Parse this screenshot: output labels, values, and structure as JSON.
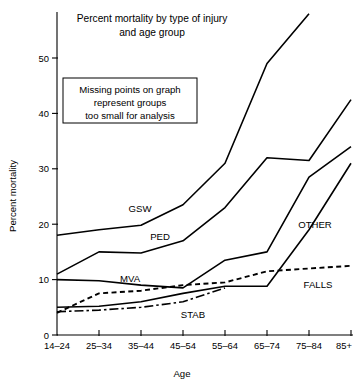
{
  "chart_data": {
    "type": "line",
    "title": "Percent mortality by type of injury and age group",
    "title_line1": "Percent mortality by type of injury",
    "title_line2": "and age group",
    "xlabel": "Age",
    "ylabel": "Percent mortality",
    "categories": [
      "14–24",
      "25–34",
      "35–44",
      "45–54",
      "55–64",
      "65–74",
      "75–84",
      "85+"
    ],
    "yticks": [
      "0",
      "10",
      "20",
      "30",
      "40",
      "50"
    ],
    "ytick_values": [
      0,
      10,
      20,
      30,
      40,
      50
    ],
    "ylim": [
      0,
      58
    ],
    "xlim": [
      0,
      7
    ],
    "grid": false,
    "legend": "inline-labels",
    "annotation_line1": "Missing points on graph",
    "annotation_line2": "represent groups",
    "annotation_line3": "too small for analysis",
    "series": [
      {
        "name": "GSW",
        "label": "GSW",
        "style": "solid",
        "values": [
          18.0,
          19.0,
          19.8,
          23.5,
          31.0,
          49.0,
          58.0,
          null
        ]
      },
      {
        "name": "PED",
        "label": "PED",
        "style": "solid",
        "values": [
          11.0,
          15.0,
          14.8,
          17.0,
          23.0,
          32.0,
          31.5,
          42.5
        ]
      },
      {
        "name": "MVA",
        "label": "MVA",
        "style": "solid",
        "values": [
          10.0,
          9.8,
          9.0,
          8.5,
          13.5,
          15.0,
          28.5,
          34.0
        ]
      },
      {
        "name": "OTHER",
        "label": "OTHER",
        "style": "solid",
        "values": [
          5.0,
          5.2,
          6.0,
          7.5,
          8.8,
          8.8,
          19.0,
          31.0
        ]
      },
      {
        "name": "FALLS",
        "label": "FALLS",
        "style": "dashed",
        "values": [
          4.0,
          7.5,
          8.0,
          9.0,
          9.5,
          11.5,
          12.0,
          12.5
        ]
      },
      {
        "name": "STAB",
        "label": "STAB",
        "style": "dashdot",
        "values": [
          4.2,
          4.5,
          5.0,
          6.0,
          8.5,
          null,
          null,
          null
        ]
      }
    ]
  },
  "series_label_positions": [
    {
      "name": "GSW",
      "x": 140,
      "y": 212
    },
    {
      "name": "PED",
      "x": 160,
      "y": 240
    },
    {
      "name": "MVA",
      "x": 130,
      "y": 282
    },
    {
      "name": "OTHER",
      "x": 315,
      "y": 228
    },
    {
      "name": "FALLS",
      "x": 318,
      "y": 288
    },
    {
      "name": "STAB",
      "x": 193,
      "y": 318
    }
  ],
  "colors": {
    "background": "#ffffff",
    "ink": "#000000"
  }
}
